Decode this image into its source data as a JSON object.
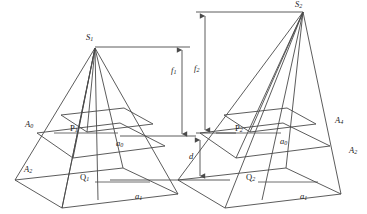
{
  "figure": {
    "background_color": "#ffffff",
    "line_color": "#4a4a4a",
    "text_color": "#1a1a1a"
  },
  "labels": {
    "apex_left": "S",
    "apex_left_sub": "1",
    "apex_right": "S",
    "apex_right_sub": "2",
    "focal_left": "f",
    "focal_left_sub": "1",
    "focal_right": "f",
    "focal_right_sub": "2",
    "separation": "d",
    "separation_sub": "",
    "plane_near_left": "P",
    "plane_near_left_sub": "1",
    "plane_far_left": "Q",
    "plane_far_left_sub": "1",
    "plane_near_right": "P",
    "plane_near_right_sub": "2",
    "plane_far_right": "Q",
    "plane_far_right_sub": "2",
    "side_near_left": "a",
    "side_near_left_sub": "0",
    "side_far_left": "a",
    "side_far_left_sub": "1",
    "side_near_right": "a",
    "side_near_right_sub": "0",
    "side_far_right": "a",
    "side_far_right_sub": "1",
    "corner_left_upper": "A",
    "corner_left_upper_sub": "0",
    "corner_left_lower": "A",
    "corner_left_lower_sub": "2",
    "corner_right_upper": "A",
    "corner_right_upper_sub": "4",
    "corner_right_lower": "A",
    "corner_right_lower_sub": "2"
  },
  "geometry": {
    "left_pyramid": {
      "apex": [
        95,
        48
      ],
      "near_quad": [
        [
          37,
          133
        ],
        [
          120,
          123
        ],
        [
          165,
          146
        ],
        [
          73,
          158
        ]
      ],
      "far_quad": [
        [
          15,
          180
        ],
        [
          123,
          168
        ],
        [
          178,
          194
        ],
        [
          62,
          208
        ]
      ],
      "upper_small_quad": [
        [
          61,
          115
        ],
        [
          124,
          108
        ],
        [
          153,
          124
        ],
        [
          87,
          132
        ]
      ]
    },
    "right_pyramid": {
      "apex": [
        303,
        12
      ],
      "near_quad": [
        [
          200,
          133
        ],
        [
          283,
          123
        ],
        [
          330,
          146
        ],
        [
          236,
          158
        ]
      ],
      "far_quad": [
        [
          178,
          180
        ],
        [
          286,
          168
        ],
        [
          341,
          194
        ],
        [
          225,
          208
        ]
      ],
      "upper_small_quad": [
        [
          224,
          115
        ],
        [
          287,
          108
        ],
        [
          316,
          124
        ],
        [
          250,
          132
        ]
      ]
    },
    "focal_arrow_left": {
      "x": 182,
      "y_top": 47,
      "y_bottom": 141
    },
    "focal_arrow_right": {
      "x": 205,
      "y_top": 12,
      "y_bottom": 141
    },
    "separation_arrow": {
      "x": 200,
      "y_top": 138,
      "y_bottom": 178
    }
  }
}
